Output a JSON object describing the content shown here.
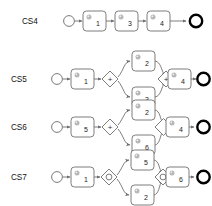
{
  "diagram": {
    "colors": {
      "stroke": "#6e6e6e",
      "end_event_stroke": "#000000",
      "text": "#222222",
      "background": "#ffffff",
      "icon": "#b9b9b9"
    },
    "gateway_markers": {
      "parallel": "+",
      "inclusive": "O",
      "exclusive": ""
    },
    "rows": [
      {
        "label": "CS4",
        "start_event": "start-event",
        "end_event": "end-event",
        "tasks": [
          "1",
          "3",
          "4"
        ],
        "gateways": [],
        "structure": "sequential"
      },
      {
        "label": "CS5",
        "start_event": "start-event",
        "end_event": "end-event",
        "tasks": [
          "1",
          "2",
          "3",
          "4"
        ],
        "gateways": [
          "+",
          "+"
        ],
        "branch_top": "2",
        "branch_bottom": "3",
        "before_split": "1",
        "after_join": "4",
        "structure": "parallel-split-join"
      },
      {
        "label": "CS6",
        "start_event": "start-event",
        "end_event": "end-event",
        "tasks": [
          "5",
          "2",
          "6",
          "4"
        ],
        "gateways": [
          "+",
          ""
        ],
        "branch_top": "2",
        "branch_bottom": "6",
        "before_split": "5",
        "after_join": "4",
        "structure": "parallel-split-exclusive-join"
      },
      {
        "label": "CS7",
        "start_event": "start-event",
        "end_event": "end-event",
        "tasks": [
          "1",
          "5",
          "2",
          "6"
        ],
        "gateways": [
          "O",
          "O"
        ],
        "branch_top": "5",
        "branch_bottom": "2",
        "before_split": "1",
        "after_join": "6",
        "structure": "inclusive-split-join"
      }
    ]
  }
}
